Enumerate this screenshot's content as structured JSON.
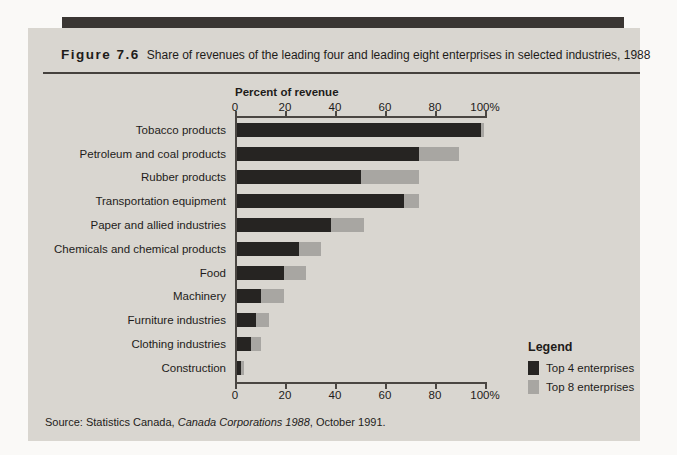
{
  "figure": {
    "number": "Figure 7.6",
    "title": "Share of revenues of the leading four and leading eight enterprises in selected industries, 1988",
    "source_prefix": "Source: Statistics Canada, ",
    "source_italic": "Canada Corporations 1988",
    "source_suffix": ", October 1991."
  },
  "chart_data": {
    "type": "bar",
    "orientation": "horizontal",
    "title": "Share of revenues of the leading four and leading eight enterprises in selected industries, 1988",
    "xlabel": "Percent of revenue",
    "ylabel": "",
    "axis_range": [
      0,
      100
    ],
    "axis_ticks": [
      "0",
      "20",
      "40",
      "60",
      "80",
      "100%"
    ],
    "grid": false,
    "categories": [
      "Tobacco products",
      "Petroleum and coal products",
      "Rubber products",
      "Transportation equipment",
      "Paper and allied industries",
      "Chemicals and chemical products",
      "Food",
      "Machinery",
      "Furniture industries",
      "Clothing industries",
      "Construction"
    ],
    "series": [
      {
        "name": "Top 4 enterprises",
        "color": "#262422",
        "values": [
          98,
          73,
          50,
          67,
          38,
          25,
          19,
          10,
          8,
          6,
          2
        ]
      },
      {
        "name": "Top 8 enterprises",
        "color": "#a8a6a2",
        "values": [
          99,
          89,
          73,
          73,
          51,
          34,
          28,
          19,
          13,
          10,
          3
        ]
      }
    ],
    "legend": {
      "title": "Legend",
      "position": "bottom-right"
    }
  }
}
